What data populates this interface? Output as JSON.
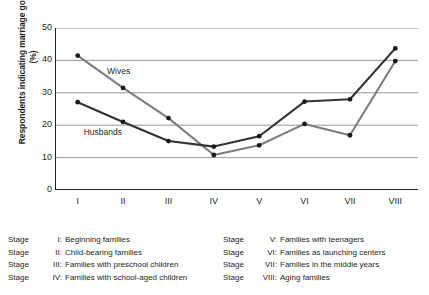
{
  "axis": {
    "ylabel": "Respondents indicating marriage going well (%)",
    "yticks": [
      "50",
      "40",
      "30",
      "20",
      "10",
      "0"
    ],
    "xticks": [
      "I",
      "II",
      "III",
      "IV",
      "V",
      "VI",
      "VII",
      "VIII"
    ]
  },
  "series_labels": {
    "wives": "Wives",
    "husbands": "Husbands"
  },
  "legend": {
    "stage_word": "Stage",
    "left": [
      {
        "numeral": "I:",
        "text": "Beginning families"
      },
      {
        "numeral": "II:",
        "text": "Child-bearing families"
      },
      {
        "numeral": "III:",
        "text": "Families with preschool children"
      },
      {
        "numeral": "IV:",
        "text": "Families with school-aged children"
      }
    ],
    "right": [
      {
        "numeral": "V:",
        "text": "Families with teenagers"
      },
      {
        "numeral": "VI:",
        "text": "Families as launching centers"
      },
      {
        "numeral": "VII:",
        "text": "Families in the middle years"
      },
      {
        "numeral": "VIII:",
        "text": "Aging families"
      }
    ]
  },
  "colors": {
    "wives": "#7d7d7d",
    "husbands": "#333333",
    "grid": "#8c8c8c",
    "axis": "#231f20",
    "marker": "#1a1a1a"
  },
  "chart_data": {
    "type": "line",
    "title": "",
    "xlabel": "",
    "ylabel": "Respondents indicating marriage going well (%)",
    "categories": [
      "I",
      "II",
      "III",
      "IV",
      "V",
      "VI",
      "VII",
      "VIII"
    ],
    "ylim": [
      0,
      50
    ],
    "yticks": [
      0,
      10,
      20,
      30,
      40,
      50
    ],
    "grid": true,
    "legend_position": "inline-annotations",
    "series": [
      {
        "name": "Wives",
        "color": "#7d7d7d",
        "values": [
          41.5,
          31.5,
          22.2,
          10.8,
          13.8,
          20.4,
          16.9,
          39.8
        ]
      },
      {
        "name": "Husbands",
        "color": "#333333",
        "values": [
          27.1,
          21.0,
          15.1,
          13.4,
          16.6,
          27.3,
          28.0,
          43.7
        ]
      }
    ]
  }
}
